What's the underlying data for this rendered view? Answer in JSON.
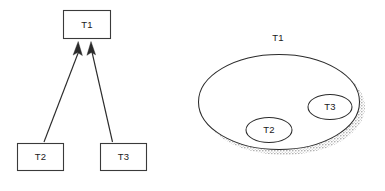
{
  "figure": {
    "background_color": "#ffffff",
    "stroke_color": "#2b2b2b",
    "text_color": "#1a1a1a",
    "shadow_color": "#b8b8b8"
  },
  "left_panel": {
    "name": "hierarchy-tree-diagram",
    "type": "node-link tree with upward arrows",
    "nodes": [
      {
        "id": "t1",
        "label": "T1",
        "shape": "rectangle",
        "x": 63,
        "y": 10,
        "w": 48,
        "h": 29
      },
      {
        "id": "t2",
        "label": "T2",
        "shape": "rectangle",
        "x": 17,
        "y": 143,
        "w": 47,
        "h": 28
      },
      {
        "id": "t3",
        "label": "T3",
        "shape": "rectangle",
        "x": 100,
        "y": 143,
        "w": 47,
        "h": 28
      }
    ],
    "edges": [
      {
        "from": "t2",
        "to": "t1",
        "arrow": "to-t1-left"
      },
      {
        "from": "t3",
        "to": "t1",
        "arrow": "to-t1-right"
      }
    ]
  },
  "right_panel": {
    "name": "nested-set-venn-diagram",
    "type": "nested ellipses with drop shadow",
    "sets": [
      {
        "id": "t1",
        "label": "T1",
        "shape": "ellipse",
        "cx": 89,
        "cy": 102,
        "rx": 81,
        "ry": 48,
        "label_x": 88,
        "label_y": 38
      },
      {
        "id": "t2",
        "label": "T2",
        "shape": "ellipse",
        "cx": 79,
        "cy": 130,
        "rx": 23,
        "ry": 12.5,
        "label_x": 79,
        "label_y": 130
      },
      {
        "id": "t3",
        "label": "T3",
        "shape": "ellipse",
        "cx": 140,
        "cy": 107,
        "rx": 22,
        "ry": 12.5,
        "label_x": 140,
        "label_y": 107
      }
    ],
    "shadow": {
      "offset_x": 5,
      "offset_y": 5,
      "style": "halftone-dots"
    }
  }
}
